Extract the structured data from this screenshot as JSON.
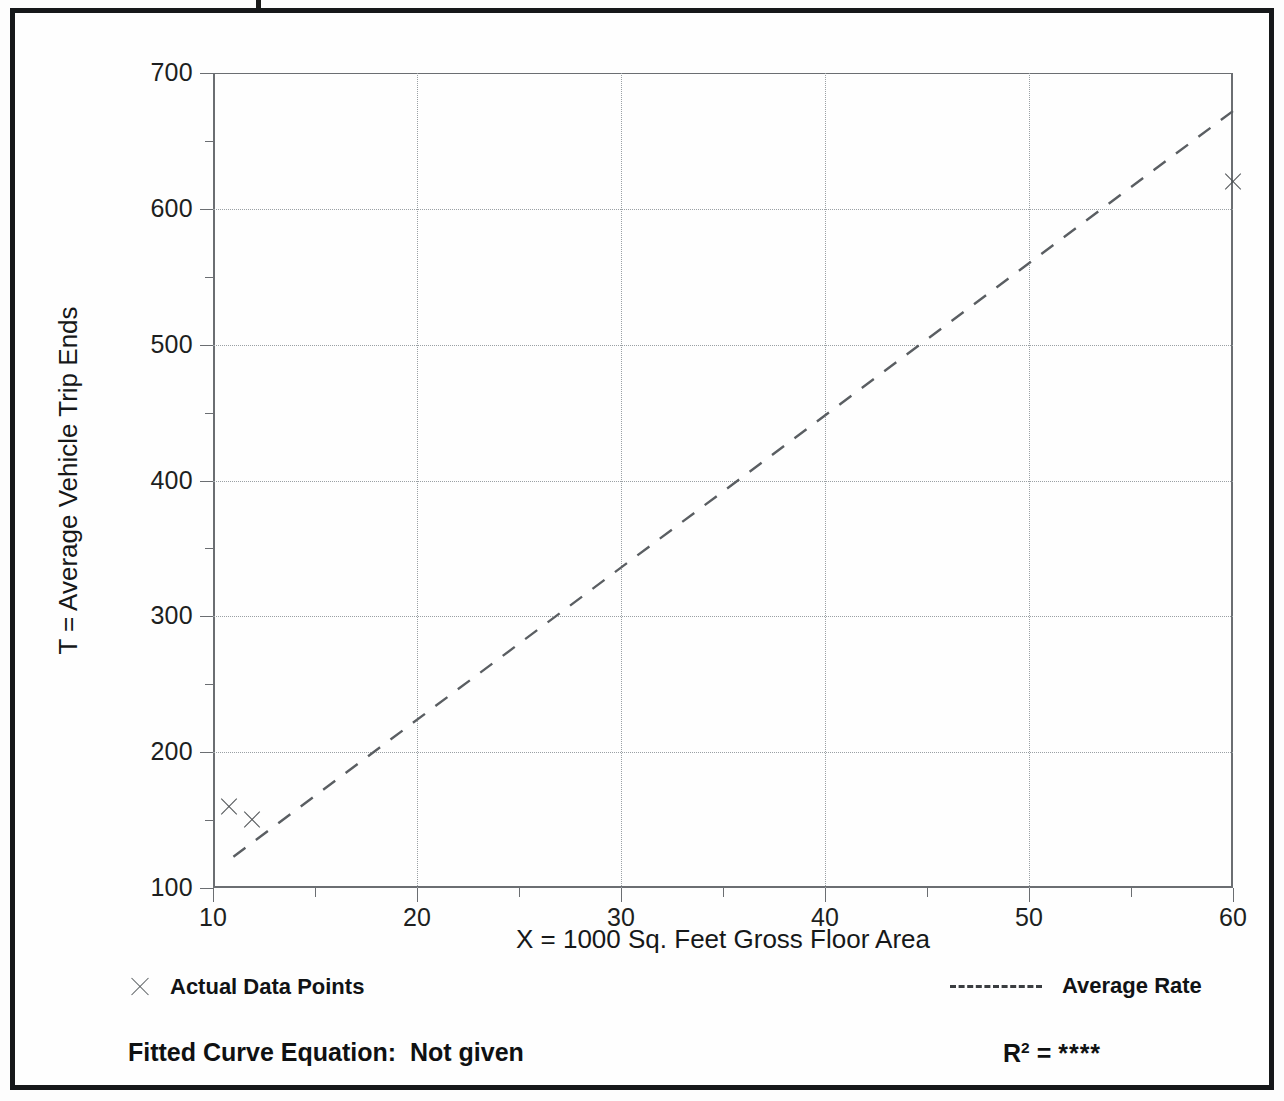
{
  "chart_data": {
    "type": "scatter",
    "title": "",
    "xlabel": "X = 1000 Sq. Feet Gross Floor Area",
    "ylabel": "T = Average Vehicle Trip Ends",
    "xlim": [
      10,
      60
    ],
    "ylim": [
      100,
      700
    ],
    "x_ticks": [
      10,
      20,
      30,
      40,
      50,
      60
    ],
    "x_tick_labels": [
      "10",
      "20",
      "30",
      "40",
      "50",
      "60"
    ],
    "x_minor_ticks": [
      15,
      25,
      35,
      45,
      55
    ],
    "y_ticks": [
      100,
      200,
      300,
      400,
      500,
      600,
      700
    ],
    "y_tick_labels": [
      "100",
      "200",
      "300",
      "400",
      "500",
      "600",
      "700"
    ],
    "y_minor_ticks": [
      150,
      250,
      350,
      450,
      550,
      650
    ],
    "grid": "dotted-major-both",
    "legend_position": "below-plot",
    "series": [
      {
        "name": "Actual Data Points",
        "type": "scatter",
        "marker": "x",
        "points": [
          {
            "x": 10.8,
            "y": 160
          },
          {
            "x": 11.9,
            "y": 150
          },
          {
            "x": 60.0,
            "y": 620
          }
        ]
      },
      {
        "name": "Average Rate",
        "type": "line",
        "style": "dashed",
        "points": [
          {
            "x": 11.0,
            "y": 123
          },
          {
            "x": 60.0,
            "y": 672
          }
        ]
      }
    ]
  },
  "axes": {
    "y_title": "T = Average Vehicle Trip Ends",
    "x_title": "X = 1000 Sq. Feet Gross Floor Area"
  },
  "legend": {
    "actual_points_label": "Actual Data Points",
    "average_rate_label": "Average Rate"
  },
  "footer": {
    "fitted_curve_equation": "Fitted Curve Equation:  Not given",
    "r2_symbol": "R",
    "r2_exponent": "2",
    "r2_equals": " = ",
    "r2_value": "****"
  },
  "colors": {
    "frame": "#16181a",
    "axis": "#6b6e72",
    "grid": "#9aa0a4",
    "marker": "#4f5356",
    "trend": "#5a5e62",
    "text": "#111315"
  }
}
